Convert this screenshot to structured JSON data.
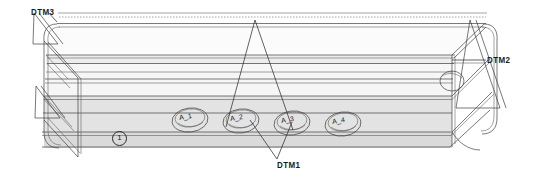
{
  "drawing": {
    "type": "isometric-engineering-drawing",
    "subject": "elongated channel part with four oval features and datum references",
    "background_color": "#ffffff",
    "line_color": "#3a3a3a",
    "fill_light": "#f2f2f2",
    "fill_mid": "#e6e6e6",
    "fill_dark": "#d8d8d8"
  },
  "datums": [
    {
      "id": "dtm3",
      "label": "DTM3",
      "position": "top-left",
      "x": 31,
      "y": 7
    },
    {
      "id": "dtm2",
      "label": "DTM2",
      "position": "right",
      "x": 487,
      "y": 55
    },
    {
      "id": "dtm1",
      "label": "DTM1",
      "position": "bottom-center",
      "x": 277,
      "y": 160
    }
  ],
  "features": [
    {
      "id": "a1",
      "label": "A_1",
      "x": 190,
      "y": 120
    },
    {
      "id": "a2",
      "label": "A_2",
      "x": 241,
      "y": 121
    },
    {
      "id": "a3",
      "label": "A_3",
      "x": 292,
      "y": 123
    },
    {
      "id": "a4",
      "label": "A_4",
      "x": 343,
      "y": 124
    }
  ],
  "callouts": [
    {
      "id": "c1",
      "label": "1",
      "shape": "circled-number",
      "x": 112,
      "y": 131
    }
  ]
}
